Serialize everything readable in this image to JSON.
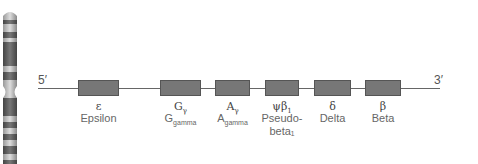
{
  "diagram": {
    "five_prime": "5′",
    "three_prime": "3′",
    "genes": [
      {
        "symbol": "ε",
        "symbol_sub": "",
        "name": "Epsilon",
        "name_sub": "",
        "name2": "",
        "x": 78,
        "w": 41
      },
      {
        "symbol": "G",
        "symbol_sub": "γ",
        "name": "G",
        "name_sub": "gamma",
        "name2": "",
        "x": 160,
        "w": 41
      },
      {
        "symbol": "A",
        "symbol_sub": "γ",
        "name": "A",
        "name_sub": "gamma",
        "name2": "",
        "x": 215,
        "w": 35
      },
      {
        "symbol": "ψβ",
        "symbol_sub": "1",
        "name": "Pseudo-",
        "name_sub": "",
        "name2": "beta₁",
        "x": 265,
        "w": 34
      },
      {
        "symbol": "δ",
        "symbol_sub": "",
        "name": "Delta",
        "name_sub": "",
        "name2": "",
        "x": 314,
        "w": 37
      },
      {
        "symbol": "β",
        "symbol_sub": "",
        "name": "Beta",
        "name_sub": "",
        "name2": "",
        "x": 365,
        "w": 36
      }
    ],
    "colors": {
      "gene_box": "#777777",
      "line": "#666666"
    }
  }
}
